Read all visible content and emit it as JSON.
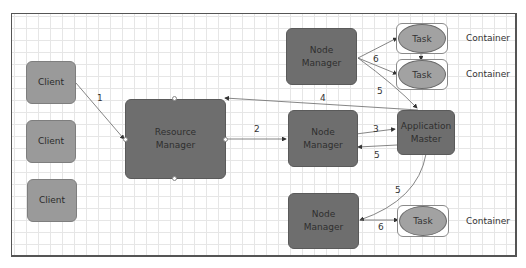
{
  "diagram": {
    "type": "yarn-application-flow",
    "nodes": {
      "client1": "Client",
      "client2": "Client",
      "client3": "Client",
      "resource_manager": "Resource Manager",
      "node_manager_top": "Node Manager",
      "node_manager_mid": "Node Manager",
      "node_manager_bottom": "Node Manager",
      "application_master": "Application Master",
      "task1": "Task",
      "task2": "Task",
      "task3": "Task"
    },
    "containers": {
      "c1": "Container",
      "c2": "Container",
      "c3": "Container"
    },
    "edges": [
      {
        "from": "client1",
        "to": "resource_manager",
        "label": "1"
      },
      {
        "from": "resource_manager",
        "to": "node_manager_mid",
        "label": "2"
      },
      {
        "from": "node_manager_mid",
        "to": "application_master",
        "label": "3"
      },
      {
        "from": "application_master",
        "to": "resource_manager",
        "label": "4"
      },
      {
        "from": "application_master",
        "to": "node_manager_mid",
        "label": "5"
      },
      {
        "from": "application_master",
        "to": "node_manager_top",
        "label": "5"
      },
      {
        "from": "application_master",
        "to": "node_manager_bottom",
        "label": "5"
      },
      {
        "from": "node_manager_top",
        "to": "task1",
        "label": "6"
      },
      {
        "from": "node_manager_top",
        "to": "task2",
        "label": "6"
      },
      {
        "from": "node_manager_bottom",
        "to": "task3",
        "label": "6"
      }
    ],
    "edge_labels": {
      "e1": "1",
      "e2": "2",
      "e3": "3",
      "e4": "4",
      "e5a": "5",
      "e5b": "5",
      "e5c": "5",
      "e6a": "6",
      "e6b": "6"
    },
    "colors": {
      "client_fill": "#9a9a9a",
      "manager_fill": "#6e6e6e",
      "task_fill": "#a2a2a2",
      "grid": "#e6e6e6",
      "edge": "#555555"
    }
  }
}
